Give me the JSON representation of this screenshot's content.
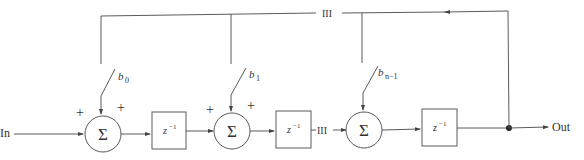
{
  "diagram": {
    "type": "signal-flow block diagram (feedback delay line with weighted taps)",
    "input_label": "In",
    "output_label": "Out",
    "ellipsis": "III",
    "summers": [
      {
        "symbol": "Σ",
        "signs": [
          "+",
          "+"
        ],
        "coefficient": "b",
        "coef_sub": "0"
      },
      {
        "symbol": "Σ",
        "signs": [
          "+",
          "+"
        ],
        "coefficient": "b",
        "coef_sub": "1"
      },
      {
        "symbol": "Σ",
        "signs": [],
        "coefficient": "b",
        "coef_sub": "n−1"
      }
    ],
    "delays": [
      {
        "label": "z",
        "sup": "−1"
      },
      {
        "label": "z",
        "sup": "−1"
      },
      {
        "label": "z",
        "sup": "−1"
      }
    ],
    "colors": {
      "line": "#5a5a5a",
      "text": "#333333",
      "background": "#ffffff"
    }
  }
}
